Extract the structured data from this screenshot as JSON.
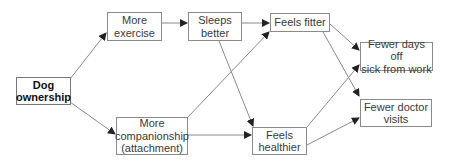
{
  "diagram": {
    "title": "",
    "nodes": [
      {
        "id": "dog",
        "label": "Dog\nownership",
        "bold": true
      },
      {
        "id": "exercise",
        "label": "More\nexercise"
      },
      {
        "id": "sleeps",
        "label": "Sleeps\nbetter"
      },
      {
        "id": "fitter",
        "label": "Feels fitter"
      },
      {
        "id": "sick",
        "label": "Fewer days off\nsick from work"
      },
      {
        "id": "companion",
        "label": "More\ncompanionship\n(attachment)"
      },
      {
        "id": "healthier",
        "label": "Feels\nhealthier"
      },
      {
        "id": "doctor",
        "label": "Fewer doctor\nvisits"
      }
    ],
    "edges": [
      {
        "from": "dog",
        "to": "exercise"
      },
      {
        "from": "dog",
        "to": "companion"
      },
      {
        "from": "exercise",
        "to": "sleeps"
      },
      {
        "from": "sleeps",
        "to": "fitter"
      },
      {
        "from": "sleeps",
        "to": "healthier"
      },
      {
        "from": "companion",
        "to": "fitter"
      },
      {
        "from": "companion",
        "to": "healthier"
      },
      {
        "from": "fitter",
        "to": "sick"
      },
      {
        "from": "fitter",
        "to": "doctor"
      },
      {
        "from": "healthier",
        "to": "sick"
      },
      {
        "from": "healthier",
        "to": "doctor"
      }
    ],
    "colors": {
      "line": "#8a8a8a",
      "arrow": "#222222",
      "text": "#3a3a3a"
    }
  }
}
